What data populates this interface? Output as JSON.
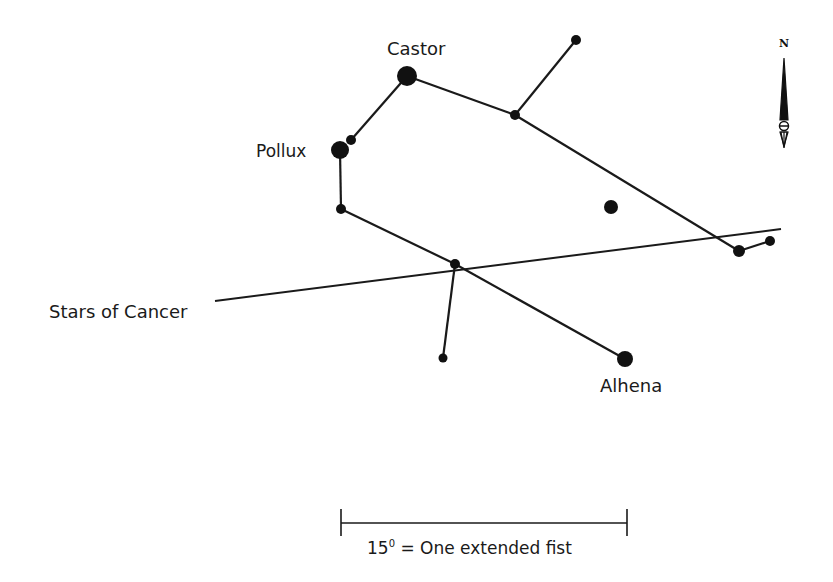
{
  "diagram": {
    "type": "star-chart",
    "constellation": "Gemini",
    "line_color": "#1a1a1a",
    "background": "#ffffff",
    "labels": {
      "castor": "Castor",
      "pollux": "Pollux",
      "alhena": "Alhena",
      "cancer": "Stars of Cancer"
    },
    "compass": {
      "north_label": "N"
    },
    "scale": {
      "label_number": "15",
      "label_degree": "0",
      "label_text": " = One extended fist"
    },
    "stars": [
      {
        "id": "castor",
        "name": "Castor",
        "x": 407,
        "y": 76,
        "r": 10
      },
      {
        "id": "pollux-companion",
        "x": 351,
        "y": 140,
        "r": 5
      },
      {
        "id": "pollux",
        "name": "Pollux",
        "x": 340,
        "y": 150,
        "r": 9
      },
      {
        "id": "s1",
        "x": 341,
        "y": 209,
        "r": 5
      },
      {
        "id": "s2",
        "x": 455,
        "y": 264,
        "r": 5
      },
      {
        "id": "s3",
        "x": 443,
        "y": 358,
        "r": 4.5
      },
      {
        "id": "alhena",
        "name": "Alhena",
        "x": 625,
        "y": 359,
        "r": 8
      },
      {
        "id": "s4",
        "x": 515,
        "y": 115,
        "r": 5
      },
      {
        "id": "s5",
        "x": 576,
        "y": 40,
        "r": 5
      },
      {
        "id": "s6",
        "x": 611,
        "y": 207,
        "r": 7
      },
      {
        "id": "s7",
        "x": 739,
        "y": 251,
        "r": 6
      },
      {
        "id": "s8",
        "x": 770,
        "y": 241,
        "r": 5
      }
    ],
    "lines": [
      [
        "pollux-companion",
        "castor"
      ],
      [
        "pollux",
        "s1"
      ],
      [
        "castor",
        "s4"
      ],
      [
        "s4",
        "s5"
      ],
      [
        "s4",
        "s7"
      ],
      [
        "s7",
        "s8"
      ],
      [
        "s1",
        "s2"
      ],
      [
        "s2",
        "alhena"
      ],
      [
        "s2",
        "s3"
      ]
    ],
    "cancer_line": {
      "x1": 215,
      "y1": 301,
      "x2": 781,
      "y2": 229
    }
  }
}
